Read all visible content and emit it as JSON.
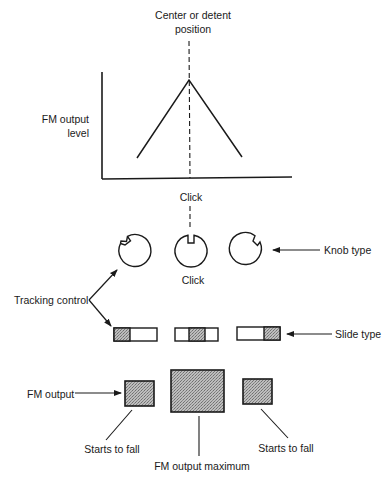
{
  "graph": {
    "top_label_line1": "Center or detent",
    "top_label_line2": "position",
    "y_axis_label_line1": "FM output",
    "y_axis_label_line2": "level",
    "click_label": "Click"
  },
  "knobs": {
    "click_label": "Click",
    "knob_type_label": "Knob type",
    "tracking_control_label": "Tracking control",
    "positions": [
      "left",
      "center",
      "right"
    ]
  },
  "sliders": {
    "slide_type_label": "Slide type",
    "positions": [
      "left",
      "center",
      "right"
    ]
  },
  "fm_output": {
    "fm_output_label": "FM output",
    "left_label": "Starts to fall",
    "center_label": "FM output maximum",
    "right_label": "Starts to fall"
  },
  "colors": {
    "ink": "#1a1a1a",
    "shade": "#a8a8a8"
  }
}
